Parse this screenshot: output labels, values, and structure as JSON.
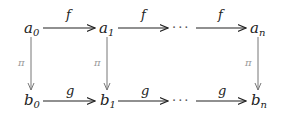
{
  "diagram": {
    "type": "commutative-diagram",
    "top_row": [
      {
        "base": "a",
        "sub": "0"
      },
      {
        "base": "a",
        "sub": "1"
      },
      {
        "base": "a",
        "sub": "n"
      }
    ],
    "bottom_row": [
      {
        "base": "b",
        "sub": "0"
      },
      {
        "base": "b",
        "sub": "1"
      },
      {
        "base": "b",
        "sub": "n"
      }
    ],
    "top_arrow_labels": [
      "f",
      "f",
      "f"
    ],
    "bottom_arrow_labels": [
      "g",
      "g",
      "g"
    ],
    "vertical_arrow_labels": [
      "π",
      "π",
      "π"
    ],
    "ellipsis": "···"
  }
}
